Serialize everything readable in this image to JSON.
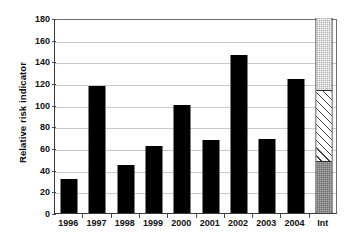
{
  "chart_data": {
    "type": "bar",
    "title": "",
    "subtitle": "",
    "xlabel": "",
    "ylabel": "Relative risk indicator",
    "ylim": [
      0,
      180
    ],
    "ytick_values": [
      0,
      20,
      40,
      60,
      80,
      100,
      120,
      140,
      160,
      180
    ],
    "ytick_labels": [
      "0",
      "20",
      "40",
      "60",
      "80",
      "100",
      "120",
      "140",
      "160",
      "180"
    ],
    "grid": true,
    "grid_axis": "y",
    "legend": "none",
    "categories": [
      "1996",
      "1997",
      "1998",
      "1999",
      "2000",
      "2001",
      "2002",
      "2003",
      "2004",
      "Int"
    ],
    "values": [
      31,
      117,
      44,
      62,
      100,
      67,
      146,
      68,
      124,
      180
    ],
    "bar_color": "#000000",
    "series": [
      {
        "name": "Relative risk indicator",
        "values": [
          31,
          117,
          44,
          62,
          100,
          67,
          146,
          68,
          124,
          null
        ]
      }
    ],
    "stacked_bar": {
      "category": "Int",
      "total": 180,
      "segments": [
        {
          "name": "lower-segment",
          "from": 0,
          "to": 48,
          "value": 48,
          "fill": "dark-gray-dotted",
          "color": "#6f6f6f"
        },
        {
          "name": "middle-segment",
          "from": 48,
          "to": 114,
          "value": 66,
          "fill": "white-diagonal-hatch",
          "color": "#ffffff"
        },
        {
          "name": "upper-segment",
          "from": 114,
          "to": 180,
          "value": 66,
          "fill": "light-gray-dotted",
          "color": "#b4b4b4"
        }
      ]
    }
  },
  "axes": {
    "y_title": "Relative risk indicator",
    "y_ticks": [
      "180",
      "160",
      "140",
      "120",
      "100",
      "80",
      "60",
      "40",
      "20",
      "0"
    ],
    "x_ticks": [
      "1996",
      "1997",
      "1998",
      "1999",
      "2000",
      "2001",
      "2002",
      "2003",
      "2004",
      "Int"
    ]
  },
  "colors": {
    "bar": "#000000",
    "segment_dark": "#6f6f6f",
    "segment_hatch": "#ffffff",
    "segment_light": "#b4b4b4",
    "gridline": "#c9c9c9",
    "axis": "#3a3a3a",
    "background": "#ffffff",
    "text": "#111111"
  }
}
